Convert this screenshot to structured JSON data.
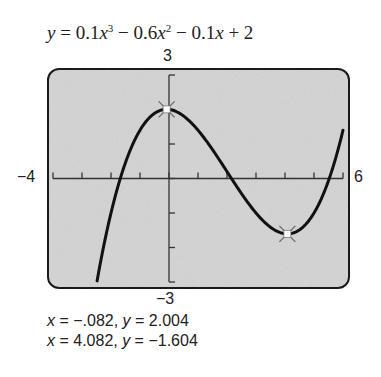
{
  "chart_data": {
    "type": "line",
    "function": "0.1*x^3 - 0.6*x^2 - 0.1*x + 2",
    "xlim": [
      -4,
      6
    ],
    "ylim": [
      -3,
      3
    ],
    "xscale_ticks": 1,
    "yscale_ticks": 1,
    "grid": false,
    "legend": null,
    "window_labels": {
      "xmin": "−4",
      "xmax": "6",
      "ymin": "−3",
      "ymax": "3"
    },
    "extrema": [
      {
        "type": "relative max",
        "x": -0.082,
        "y": 2.004,
        "label": "x = −.082, y = 2.004"
      },
      {
        "type": "relative min",
        "x": 4.082,
        "y": -1.604,
        "label": "x = 4.082, y = −1.604"
      }
    ],
    "colors": {
      "screen": "#d4d4d4",
      "curve": "#111111",
      "frame": "#1a1a1a"
    }
  },
  "equation": {
    "lhs": "y",
    "eq": " = 0.1",
    "t1var": "x",
    "t1exp": "3",
    "t2": " − 0.6",
    "t2var": "x",
    "t2exp": "2",
    "t3": " − 0.1",
    "t3var": "x",
    "t4": " + 2"
  },
  "labels": {
    "ymax": "3",
    "ymin": "−3",
    "xmin": "−4",
    "xmax": "6"
  },
  "readouts": [
    {
      "xvar": "x",
      "xval": " = −.082, ",
      "yvar": "y",
      "yval": " = 2.004"
    },
    {
      "xvar": "x",
      "xval": " = 4.082, ",
      "yvar": "y",
      "yval": " = −1.604"
    }
  ]
}
